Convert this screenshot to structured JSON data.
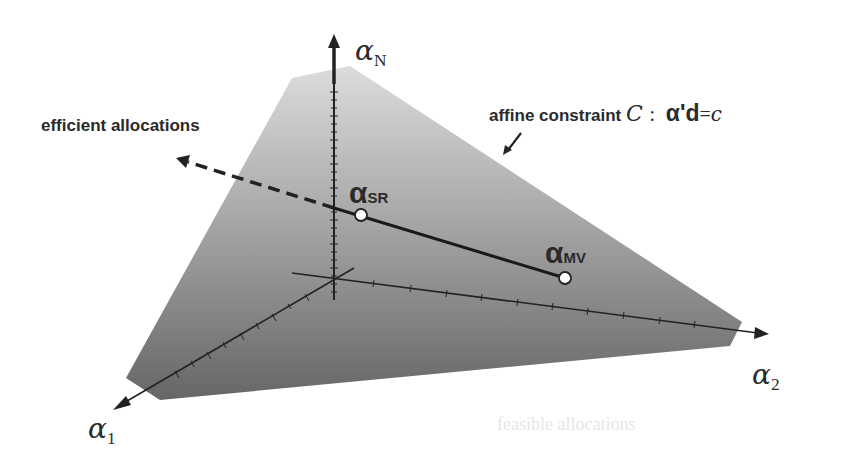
{
  "diagram": {
    "colors": {
      "plane_top": "#d6d6d6",
      "plane_bottom": "#6a6a6a",
      "axis": "#222222",
      "line": "#1a1a1a",
      "point_fill": "#ffffff",
      "text": "#2a2a2a"
    },
    "axes": {
      "alpha_N": {
        "symbol": "α",
        "subscript": "N"
      },
      "alpha_1": {
        "symbol": "α",
        "subscript": "1"
      },
      "alpha_2": {
        "symbol": "α",
        "subscript": "2"
      }
    },
    "labels": {
      "efficient_allocations": "efficient allocations",
      "affine_constraint_text": "affine constraint",
      "constraint_symbol": "C",
      "constraint_colon": ":",
      "constraint_lhs": "α'd",
      "constraint_eq": "=",
      "constraint_rhs": "c"
    },
    "points": {
      "sr": {
        "symbol": "α",
        "subscript": "SR"
      },
      "mv": {
        "symbol": "α",
        "subscript": "MV"
      }
    },
    "ghost_text": "feasible allocations"
  }
}
